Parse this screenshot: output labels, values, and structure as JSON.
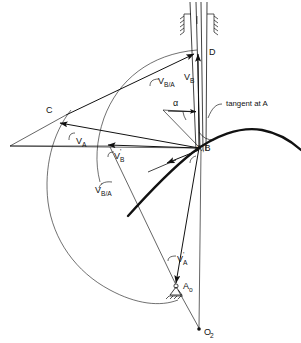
{
  "figure": {
    "type": "kinematics-velocity-diagram",
    "background": "#ffffff",
    "line_color": "#111111"
  },
  "points": [
    {
      "id": "D",
      "label": "D",
      "x": 205,
      "y": 52,
      "desc": "tip of V_B vector on vertical guide"
    },
    {
      "id": "C",
      "label": "C",
      "x": 47,
      "y": 118,
      "desc": "tip of V_A vector"
    },
    {
      "id": "AB",
      "label": "A,B",
      "x": 200,
      "y": 148,
      "desc": "coincident points A and B, vector origin"
    },
    {
      "id": "Ao",
      "label": "A",
      "sub": "o",
      "x": 177,
      "y": 287,
      "desc": "fixed pivot of follower arm"
    },
    {
      "id": "O2",
      "label": "O",
      "sub": "2",
      "x": 199,
      "y": 330,
      "desc": "fixed cam center"
    }
  ],
  "vectors": [
    {
      "id": "v_b",
      "label": "V",
      "sub": "B",
      "prime": "",
      "label_x": 188,
      "label_y": 76,
      "desc": "velocity of B, vertical up"
    },
    {
      "id": "v_ba",
      "label": "V",
      "sub": "B/A",
      "prime": "",
      "label_x": 140,
      "label_y": 80,
      "desc": "relative velocity of B with respect to A"
    },
    {
      "id": "v_a",
      "label": "V",
      "sub": "A",
      "prime": "",
      "label_x": 77,
      "label_y": 140,
      "desc": "velocity of A"
    },
    {
      "id": "v_b_pr",
      "label": "V",
      "sub": "B",
      "prime": "'",
      "label_x": 115,
      "label_y": 158,
      "desc": "alternate velocity of B"
    },
    {
      "id": "v_ba_pr",
      "label": "V",
      "sub": "B/A",
      "prime": "'",
      "label_x": 96,
      "label_y": 192,
      "desc": "alternate relative velocity of B with respect to A"
    },
    {
      "id": "v_a_pr",
      "label": "V",
      "sub": "A",
      "prime": "'",
      "label_x": 178,
      "label_y": 258,
      "desc": "alternate velocity of A"
    }
  ],
  "annotations": [
    {
      "id": "alpha",
      "label": "α",
      "x": 175,
      "y": 104,
      "desc": "angle between guide axis and V_B/A"
    },
    {
      "id": "tangent",
      "label": "tangent at A",
      "x": 228,
      "y": 108,
      "desc": "tangent line to the cam profile at point A"
    }
  ],
  "curves": [
    {
      "id": "cam-profile",
      "desc": "bold curve representing the cam profile / path of A"
    },
    {
      "id": "guide-slot",
      "desc": "vertical slotted guide with ground hatching at top"
    },
    {
      "id": "arc-vb",
      "desc": "construction arc swept from D"
    },
    {
      "id": "arc-va",
      "desc": "construction arc swept from C"
    }
  ],
  "ground_symbols": [
    {
      "id": "guide-hatch",
      "desc": "hatching on both sides of vertical guide at top"
    },
    {
      "id": "pivot-ground",
      "desc": "hatched ground triangle under point A_o"
    }
  ]
}
